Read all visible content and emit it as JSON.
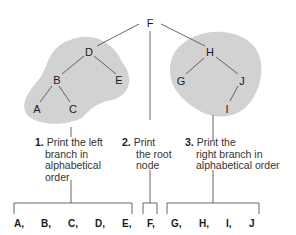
{
  "tree": {
    "root": "F",
    "left_subtree": {
      "nodes": [
        "D",
        "B",
        "E",
        "A",
        "C"
      ],
      "edges": [
        [
          "D",
          "B"
        ],
        [
          "D",
          "E"
        ],
        [
          "B",
          "A"
        ],
        [
          "B",
          "C"
        ]
      ]
    },
    "right_subtree": {
      "nodes": [
        "H",
        "G",
        "J",
        "I"
      ],
      "edges": [
        [
          "H",
          "G"
        ],
        [
          "H",
          "J"
        ],
        [
          "J",
          "I"
        ]
      ]
    },
    "labels": {
      "F": "F",
      "D": "D",
      "B": "B",
      "E": "E",
      "A": "A",
      "C": "C",
      "H": "H",
      "G": "G",
      "J": "J",
      "I": "I"
    }
  },
  "steps": [
    {
      "number": "1.",
      "lines": [
        "Print the left",
        "branch in",
        "alphabetical",
        "order"
      ]
    },
    {
      "number": "2.",
      "lines": [
        "Print",
        "the root",
        "node"
      ]
    },
    {
      "number": "3.",
      "lines": [
        "Print the",
        "right branch in",
        "alphabetical order"
      ]
    }
  ],
  "output": [
    "A,",
    "B,",
    "C,",
    "D,",
    "E,",
    "F,",
    "G,",
    "H,",
    "I,",
    "J"
  ],
  "colors": {
    "blob": "#d2d2d2",
    "line": "#555555",
    "text": "#1a1a1a"
  }
}
